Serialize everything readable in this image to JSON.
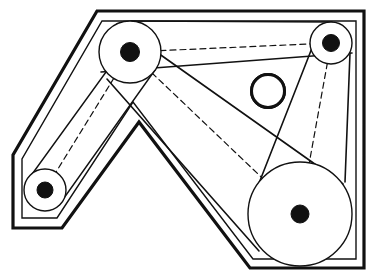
{
  "diagram": {
    "title": "Belt drive mechanism with four pulleys and hatched idler roller",
    "canvas": {
      "width": 374,
      "height": 279,
      "background": "#ffffff"
    },
    "line_color": "#111111",
    "fill_color": "#ffffff",
    "frame": {
      "label": "machine-housing-outline",
      "outer_path": "M 97,11 L 364,11 L 364,268 L 250,268 L 139,122 L 62,228 L 13,228 L 13,155 Z",
      "inner_path": "M 102,21 L 356,21 L 356,259 L 253,259 L 133,102 L 57,218 L 22,218 L 22,159 Z",
      "outer_stroke_width": 3.2,
      "inner_stroke_width": 1.4
    },
    "pulleys": [
      {
        "name": "pulley-top-left",
        "cx": 130,
        "cy": 52,
        "rim_radius": 31,
        "hub_radius": 9.5,
        "rim_stroke_width": 1.4
      },
      {
        "name": "pulley-top-right",
        "cx": 331,
        "cy": 43,
        "rim_radius": 21,
        "hub_radius": 8.5,
        "rim_stroke_width": 1.4
      },
      {
        "name": "pulley-bottom-left",
        "cx": 45,
        "cy": 190,
        "rim_radius": 21,
        "hub_radius": 8.0,
        "rim_stroke_width": 1.4
      },
      {
        "name": "pulley-bottom-right",
        "cx": 300,
        "cy": 214,
        "rim_radius": 52,
        "hub_radius": 9.0,
        "rim_stroke_width": 1.4
      }
    ],
    "idler": {
      "name": "idler-roller-hatched",
      "cx": 268,
      "cy": 91,
      "radius": 16.5,
      "stroke_width": 3.0,
      "hatch_angle_deg": 45,
      "hatch_spacing": 4.5,
      "hatch_stroke_width": 1.1
    },
    "belt_segments": [
      {
        "name": "belt-top-left-to-top-right-upper",
        "x1": 131,
        "y1": 21,
        "x2": 332,
        "y2": 22,
        "stroke_width": 1.6
      },
      {
        "name": "belt-top-left-to-top-right-lower",
        "x1": 101,
        "y1": 72,
        "x2": 352,
        "y2": 53,
        "stroke_width": 1.6
      },
      {
        "name": "belt-top-right-to-bottom-right-left-side",
        "x1": 312,
        "y1": 48,
        "x2": 252,
        "y2": 201,
        "stroke_width": 1.6
      },
      {
        "name": "belt-top-right-to-bottom-right-right-side",
        "x1": 350,
        "y1": 53,
        "x2": 345,
        "y2": 182,
        "stroke_width": 1.6
      },
      {
        "name": "belt-top-left-to-bottom-right-upper",
        "x1": 117,
        "y1": 24,
        "x2": 343,
        "y2": 184,
        "stroke_width": 1.6
      },
      {
        "name": "belt-top-left-to-bottom-right-lower",
        "x1": 107,
        "y1": 79,
        "x2": 259,
        "y2": 251,
        "stroke_width": 1.6
      },
      {
        "name": "belt-top-left-to-bottom-left-outer",
        "x1": 106,
        "y1": 72,
        "x2": 30,
        "y2": 177,
        "stroke_width": 1.4
      },
      {
        "name": "belt-top-left-to-bottom-left-inner",
        "x1": 155,
        "y1": 70,
        "x2": 59,
        "y2": 205,
        "stroke_width": 1.4
      }
    ],
    "link_lines": [
      {
        "name": "link-top-left-to-top-right",
        "x1": 130,
        "y1": 52,
        "x2": 331,
        "y2": 43
      },
      {
        "name": "link-top-left-to-bottom-left",
        "x1": 130,
        "y1": 52,
        "x2": 45,
        "y2": 190
      },
      {
        "name": "link-top-left-to-bottom-right",
        "x1": 130,
        "y1": 52,
        "x2": 300,
        "y2": 214
      },
      {
        "name": "link-top-right-to-bottom-right",
        "x1": 331,
        "y1": 43,
        "x2": 300,
        "y2": 214
      }
    ],
    "link_style": {
      "stroke_width": 1.2,
      "dash_pattern": "6 4"
    }
  }
}
